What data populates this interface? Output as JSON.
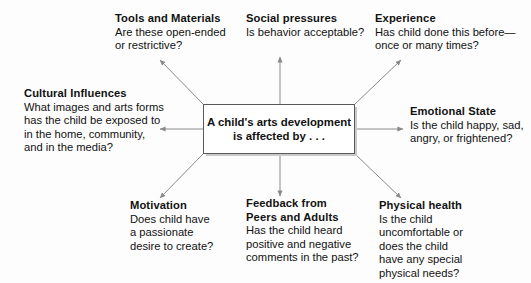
{
  "diagram": {
    "type": "concept-map",
    "title_center": {
      "line1": "A child's arts development",
      "line2": "is affected by . . ."
    },
    "background_color": "#fdfdfd",
    "line_color": "#7a7a7a",
    "box_border_color": "#5a5a5a",
    "box_shadow_color": "#c9c9c9",
    "text_color": "#111111",
    "nodes": [
      {
        "id": "tools-and-materials",
        "title": "Tools and Materials",
        "lines": [
          "Are these open-ended",
          "or restrictive?"
        ],
        "position": "top-left"
      },
      {
        "id": "social-pressures",
        "title": "Social pressures",
        "lines": [
          "Is behavior acceptable?"
        ],
        "position": "top-center"
      },
      {
        "id": "experience",
        "title": "Experience",
        "lines": [
          "Has child done this before—",
          "once or many times?"
        ],
        "position": "top-right"
      },
      {
        "id": "cultural-influences",
        "title": "Cultural Influences",
        "lines": [
          "What images and arts forms",
          "has the child be exposed to",
          "in the home, community,",
          "and in the media?"
        ],
        "position": "middle-left"
      },
      {
        "id": "emotional-state",
        "title": "Emotional State",
        "lines": [
          "Is the child happy, sad,",
          "angry, or frightened?"
        ],
        "position": "middle-right"
      },
      {
        "id": "motivation",
        "title": "Motivation",
        "lines": [
          "Does child have",
          "a passionate",
          "desire to create?"
        ],
        "position": "bottom-left"
      },
      {
        "id": "feedback-from-peers-and-adults",
        "title": "Feedback from",
        "title2": "Peers and Adults",
        "lines": [
          "Has the child heard",
          "positive and negative",
          "comments in the past?"
        ],
        "position": "bottom-center"
      },
      {
        "id": "physical-health",
        "title": "Physical health",
        "lines": [
          "Is the child",
          "uncomfortable or",
          "does the child",
          "have any special",
          "physical needs?"
        ],
        "position": "bottom-right"
      }
    ]
  }
}
